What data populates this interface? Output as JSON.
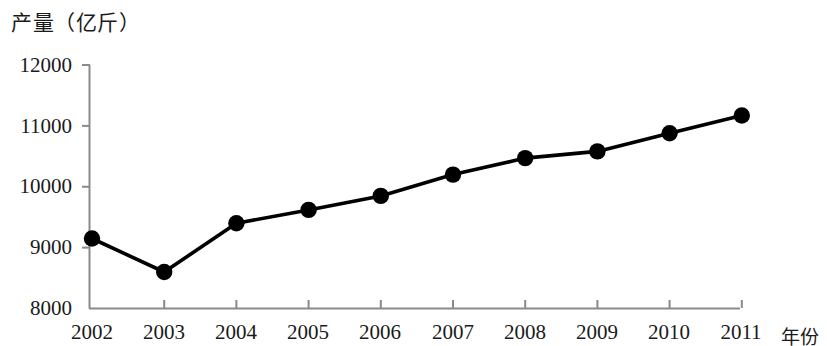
{
  "chart_data": {
    "type": "line",
    "title": "",
    "ylabel": "产量（亿斤）",
    "xlabel": "年份",
    "categories": [
      "2002",
      "2003",
      "2004",
      "2005",
      "2006",
      "2007",
      "2008",
      "2009",
      "2010",
      "2011"
    ],
    "values": [
      9150,
      8600,
      9400,
      9620,
      9850,
      10200,
      10470,
      10580,
      10880,
      11170
    ],
    "ylim": [
      8000,
      12000
    ],
    "ytick_labels": [
      "8000",
      "9000",
      "10000",
      "11000",
      "12000"
    ],
    "ytick_values": [
      8000,
      9000,
      10000,
      11000,
      12000
    ],
    "grid": false,
    "legend": "none",
    "series": [
      {
        "name": "产量",
        "values": [
          9150,
          8600,
          9400,
          9620,
          9850,
          10200,
          10470,
          10580,
          10880,
          11170
        ],
        "marker": "filled-circle",
        "color": "#000000"
      }
    ],
    "line_color": "#000000",
    "marker_color": "#000000",
    "axis_color": "#808080"
  },
  "axes": {
    "y_axis_title": "产量（亿斤）",
    "x_axis_title": "年份"
  }
}
